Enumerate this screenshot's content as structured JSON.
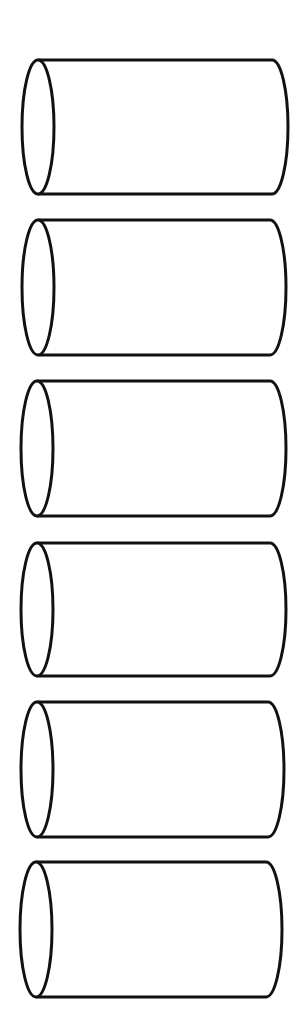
{
  "diagram": {
    "title": "",
    "shape": "cylinder",
    "orientation": "horizontal",
    "stroke_color": "#111111",
    "fill_color": "#ffffff",
    "background": "#ffffff",
    "cylinders": [
      {
        "id": 1,
        "x1": 38,
        "x2": 272,
        "top": 60,
        "bottom": 194,
        "ellipse_rx": 16
      },
      {
        "id": 2,
        "x1": 38,
        "x2": 270,
        "top": 220,
        "bottom": 355,
        "ellipse_rx": 16
      },
      {
        "id": 3,
        "x1": 37,
        "x2": 270,
        "top": 381,
        "bottom": 516,
        "ellipse_rx": 16
      },
      {
        "id": 4,
        "x1": 37,
        "x2": 270,
        "top": 543,
        "bottom": 676,
        "ellipse_rx": 16
      },
      {
        "id": 5,
        "x1": 37,
        "x2": 268,
        "top": 702,
        "bottom": 837,
        "ellipse_rx": 16
      },
      {
        "id": 6,
        "x1": 36,
        "x2": 266,
        "top": 862,
        "bottom": 997,
        "ellipse_rx": 16
      }
    ]
  }
}
